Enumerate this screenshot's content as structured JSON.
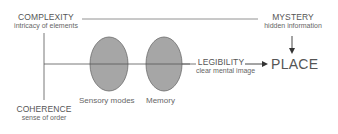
{
  "diagram": {
    "nodes": {
      "complexity": {
        "title": "COMPLEXITY",
        "subtitle": "intricacy of elements"
      },
      "mystery": {
        "title": "MYSTERY",
        "subtitle": "hidden information"
      },
      "coherence": {
        "title": "COHERENCE",
        "subtitle": "sense of order"
      },
      "legibility": {
        "title": "LEGIBILITY",
        "subtitle": "clear mental image"
      },
      "place": {
        "title": "PLACE"
      }
    },
    "ellipses": [
      {
        "label": "Sensory modes"
      },
      {
        "label": "Memory"
      }
    ],
    "colors": {
      "ellipse_fill": "#a6a6a6",
      "ellipse_stroke": "#6b6b6b",
      "line": "#555555",
      "text": "#555555"
    }
  }
}
